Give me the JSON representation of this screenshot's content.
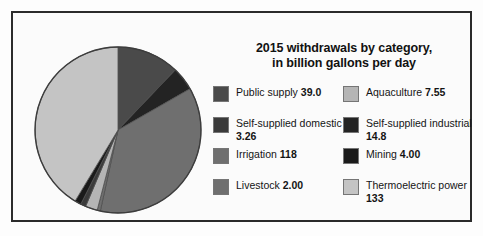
{
  "chart_data": {
    "type": "pie",
    "title": "2015 withdrawals by category, in billion gallons per day",
    "title_line1": "2015 withdrawals by category,",
    "title_line2": "in billion gallons per day",
    "units": "billion gallons per day",
    "total": 322.61,
    "categories": [
      "Public supply",
      "Self-supplied industrial",
      "Irrigation",
      "Livestock",
      "Aquaculture",
      "Self-supplied domestic",
      "Mining",
      "Thermoelectric power"
    ],
    "values": [
      39.0,
      14.8,
      118,
      2.0,
      7.55,
      3.26,
      4.0,
      133
    ],
    "colors": [
      "#4a4a4a",
      "#232323",
      "#6f6f6f",
      "#6f6f6f",
      "#b5b5b5",
      "#3a3a3a",
      "#1a1a1a",
      "#c4c4c4"
    ],
    "legend_position": "right",
    "grid": false,
    "slice_order_clockwise_from_12": [
      "Public supply",
      "Self-supplied industrial",
      "Irrigation",
      "Livestock",
      "Aquaculture",
      "Self-supplied domestic",
      "Mining",
      "Thermoelectric power"
    ]
  },
  "legend": {
    "items": [
      {
        "label": "Public supply",
        "value": "39.0",
        "color": "#4a4a4a",
        "swatch_name": "swatch-public-supply"
      },
      {
        "label": "Aquaculture",
        "value": "7.55",
        "color": "#b5b5b5",
        "swatch_name": "swatch-aquaculture"
      },
      {
        "label": "Self-supplied domestic",
        "value": "3.26",
        "color": "#3a3a3a",
        "swatch_name": "swatch-self-supplied-domestic"
      },
      {
        "label": "Self-supplied industrial",
        "value": "14.8",
        "color": "#232323",
        "swatch_name": "swatch-self-supplied-industrial"
      },
      {
        "label": "Irrigation",
        "value": "118",
        "color": "#6f6f6f",
        "swatch_name": "swatch-irrigation"
      },
      {
        "label": "Mining",
        "value": "4.00",
        "color": "#1a1a1a",
        "swatch_name": "swatch-mining"
      },
      {
        "label": "Livestock",
        "value": "2.00",
        "color": "#6f6f6f",
        "swatch_name": "swatch-livestock"
      },
      {
        "label": "Thermoelectric power",
        "value": "133",
        "color": "#c4c4c4",
        "swatch_name": "swatch-thermoelectric-power"
      }
    ]
  }
}
